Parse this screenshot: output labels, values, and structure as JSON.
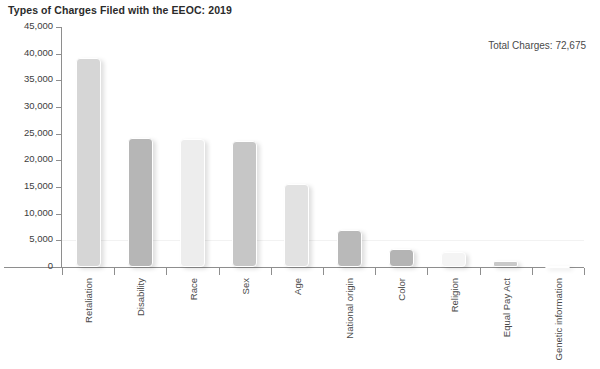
{
  "chart_data": {
    "type": "bar",
    "title": "Types of Charges Filed with the EEOC: 2019",
    "xlabel": "",
    "ylabel": "",
    "ylim": [
      0,
      45000
    ],
    "ytick_labels": [
      "45,000",
      "40,000",
      "35,000",
      "30,000",
      "25,000",
      "20,000",
      "15,000",
      "10,000",
      "5,000",
      "0"
    ],
    "ytick_values": [
      45000,
      40000,
      35000,
      30000,
      25000,
      20000,
      15000,
      10000,
      5000,
      0
    ],
    "grid": true,
    "legend": "none",
    "annotation": "Total Charges: 72,675",
    "categories": [
      "Retaliation",
      "Disability",
      "Race",
      "Sex",
      "Age",
      "National origin",
      "Color",
      "Religion",
      "Equal Pay Act",
      "Genetic information"
    ],
    "values": [
      39110,
      24238,
      23976,
      23532,
      15573,
      7009,
      3415,
      2725,
      1117,
      209
    ],
    "bar_colors": [
      "#d6d6d6",
      "#b6b6b6",
      "#ededed",
      "#c6c6c6",
      "#e2e2e2",
      "#b9b9b9",
      "#b4b4b4",
      "#f4f4f4",
      "#c9c9c9",
      "#fbfbfb"
    ]
  },
  "chart": {
    "title": "Types of Charges Filed with the EEOC: 2019",
    "total_label": "Total Charges: 72,675"
  }
}
